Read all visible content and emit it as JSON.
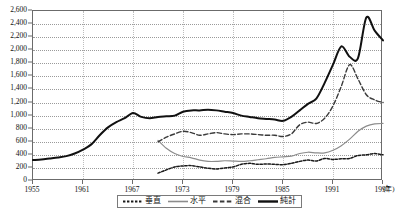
{
  "chart_data": {
    "type": "line",
    "title": "",
    "subtitle": "",
    "xlabel": "年",
    "ylabel": "",
    "xlim": [
      1955,
      1997
    ],
    "ylim": [
      0,
      2600
    ],
    "grid": true,
    "legend_position": "bottom",
    "y_ticks": [
      0,
      200,
      400,
      600,
      800,
      1000,
      1200,
      1400,
      1600,
      1800,
      2000,
      2200,
      2400,
      2600
    ],
    "y_tick_labels": [
      "0",
      "200",
      "400",
      "600",
      "800",
      "1,000",
      "1,200",
      "1,400",
      "1,600",
      "1,800",
      "2,000",
      "2,200",
      "2,400",
      "2,600"
    ],
    "x_ticks": [
      1955,
      1961,
      1967,
      1973,
      1979,
      1985,
      1991,
      1997
    ],
    "x_tick_labels": [
      "1955",
      "1961",
      "1967",
      "1973",
      "1979",
      "1985",
      "1991",
      "1997"
    ],
    "x_unit_label": "(年)",
    "x": [
      1955,
      1956,
      1957,
      1958,
      1959,
      1960,
      1961,
      1962,
      1963,
      1964,
      1965,
      1966,
      1967,
      1968,
      1969,
      1970,
      1971,
      1972,
      1973,
      1974,
      1975,
      1976,
      1977,
      1978,
      1979,
      1980,
      1981,
      1982,
      1983,
      1984,
      1985,
      1986,
      1987,
      1988,
      1989,
      1990,
      1991,
      1992,
      1993,
      1994,
      1995,
      1996,
      1997
    ],
    "series": [
      {
        "name": "垂直",
        "style": "dotted",
        "color": "#1a1a1a",
        "x_start": 1970,
        "values": [
          null,
          null,
          null,
          null,
          null,
          null,
          null,
          null,
          null,
          null,
          null,
          null,
          null,
          null,
          null,
          120,
          170,
          215,
          230,
          235,
          215,
          195,
          185,
          200,
          215,
          255,
          270,
          255,
          260,
          255,
          250,
          270,
          300,
          320,
          305,
          345,
          330,
          340,
          345,
          390,
          400,
          420,
          400
        ]
      },
      {
        "name": "水平",
        "style": "solid-gray",
        "color": "#8c8c8c",
        "x_start": 1970,
        "values": [
          null,
          null,
          null,
          null,
          null,
          null,
          null,
          null,
          null,
          null,
          null,
          null,
          null,
          null,
          null,
          620,
          500,
          420,
          375,
          355,
          320,
          300,
          300,
          310,
          305,
          300,
          310,
          325,
          340,
          360,
          370,
          380,
          420,
          440,
          430,
          430,
          470,
          540,
          640,
          760,
          840,
          875,
          880
        ]
      },
      {
        "name": "混合",
        "style": "dashed",
        "color": "#3a3a3a",
        "x_start": 1970,
        "values": [
          null,
          null,
          null,
          null,
          null,
          null,
          null,
          null,
          null,
          null,
          null,
          null,
          null,
          null,
          null,
          600,
          670,
          720,
          760,
          740,
          700,
          720,
          740,
          720,
          710,
          720,
          720,
          710,
          700,
          700,
          680,
          720,
          860,
          900,
          880,
          960,
          1150,
          1450,
          1780,
          1560,
          1320,
          1240,
          1200
        ]
      },
      {
        "name": "純計",
        "style": "solid-black",
        "color": "#111111",
        "x_start": 1955,
        "values": [
          320,
          330,
          345,
          360,
          380,
          420,
          480,
          560,
          700,
          820,
          900,
          960,
          1040,
          980,
          960,
          980,
          990,
          1000,
          1060,
          1080,
          1080,
          1090,
          1080,
          1060,
          1040,
          1000,
          980,
          960,
          950,
          940,
          920,
          980,
          1080,
          1180,
          1260,
          1500,
          1780,
          2060,
          1900,
          1880,
          2500,
          2300,
          2150
        ]
      }
    ]
  },
  "legend": {
    "items": [
      {
        "label": "垂直",
        "style": "dotted"
      },
      {
        "label": "水平",
        "style": "solid-gray"
      },
      {
        "label": "混合",
        "style": "dashed"
      },
      {
        "label": "純計",
        "style": "solid-black"
      }
    ]
  }
}
